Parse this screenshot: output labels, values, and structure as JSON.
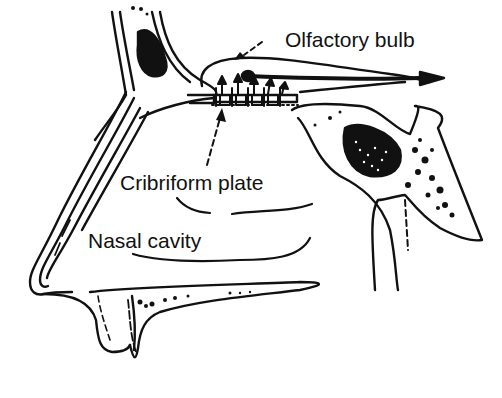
{
  "diagram": {
    "style": "black-and-white line drawing",
    "colors": {
      "ink": "#111111",
      "background": "#ffffff"
    },
    "top_cropped_text": "(·)",
    "labels": {
      "olfactory_bulb": "Olfactory bulb",
      "cribriform_plate": "Cribriform plate",
      "nasal_cavity": "Nasal cavity"
    },
    "leader_lines": [
      {
        "from": "olfactory_bulb",
        "style": "dashed-arrow",
        "target": "upper membrane of bulb"
      },
      {
        "from": "cribriform_plate",
        "style": "dashed-arrow",
        "target": "perforated plate with receptor cells"
      }
    ],
    "arrows": [
      {
        "name": "olfactory-tract-arrow",
        "direction": "right"
      },
      {
        "name": "receptor-axon-arrows",
        "count": 5,
        "direction": "up"
      }
    ]
  }
}
